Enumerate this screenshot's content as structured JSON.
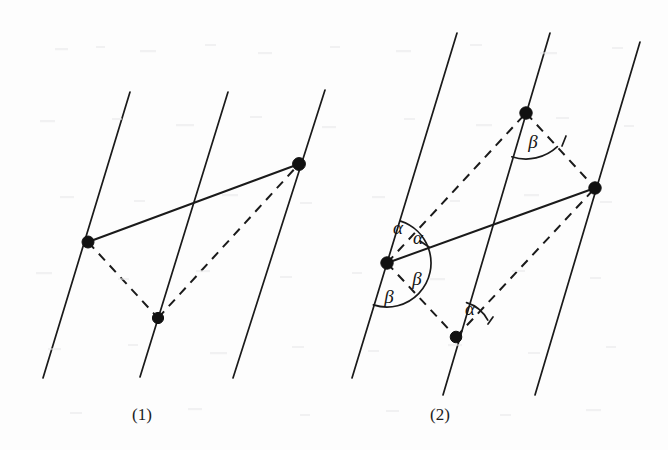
{
  "figure": {
    "background_color": "#fdfdfd",
    "ink_color": "#1a1a1a",
    "panels": [
      {
        "id": "panel-1",
        "caption": "(1)",
        "caption_x": 142,
        "caption_y": 420,
        "parallel_lines": [
          {
            "name": "line-left",
            "x1": 130,
            "y1": 92,
            "x2": 43,
            "y2": 378
          },
          {
            "name": "line-middle",
            "x1": 228,
            "y1": 92,
            "x2": 140,
            "y2": 377
          },
          {
            "name": "line-right",
            "x1": 325,
            "y1": 90,
            "x2": 233,
            "y2": 378
          }
        ],
        "points": [
          {
            "name": "point-left",
            "x": 88,
            "y": 242,
            "r": 6.0
          },
          {
            "name": "point-top-right",
            "x": 299,
            "y": 164,
            "r": 6.4
          },
          {
            "name": "point-bottom-middle",
            "x": 158,
            "y": 318,
            "r": 5.6
          }
        ],
        "solid_segments": [
          {
            "name": "segment-left-to-topright",
            "x1": 88,
            "y1": 242,
            "x2": 299,
            "y2": 164
          }
        ],
        "dashed_segments": [
          {
            "name": "segment-left-to-bottom",
            "x1": 88,
            "y1": 242,
            "x2": 158,
            "y2": 318
          },
          {
            "name": "segment-bottom-to-topright",
            "x1": 158,
            "y1": 318,
            "x2": 299,
            "y2": 164
          }
        ],
        "angle_labels": [],
        "angle_arcs": []
      },
      {
        "id": "panel-2",
        "caption": "(2)",
        "caption_x": 440,
        "caption_y": 420,
        "parallel_lines": [
          {
            "name": "line-left",
            "x1": 457,
            "y1": 33,
            "x2": 352,
            "y2": 378
          },
          {
            "name": "line-middle",
            "x1": 550,
            "y1": 33,
            "x2": 443,
            "y2": 395
          },
          {
            "name": "line-right",
            "x1": 640,
            "y1": 42,
            "x2": 535,
            "y2": 395
          }
        ],
        "points": [
          {
            "name": "point-top-middle",
            "x": 526,
            "y": 113,
            "r": 6.2
          },
          {
            "name": "point-right",
            "x": 595,
            "y": 188,
            "r": 6.2
          },
          {
            "name": "point-left",
            "x": 387,
            "y": 263,
            "r": 6.2
          },
          {
            "name": "point-bottom-middle",
            "x": 456,
            "y": 337,
            "r": 5.8
          }
        ],
        "solid_segments": [
          {
            "name": "segment-left-to-right",
            "x1": 387,
            "y1": 263,
            "x2": 595,
            "y2": 188
          }
        ],
        "dashed_segments": [
          {
            "name": "segment-left-to-topmiddle",
            "x1": 387,
            "y1": 263,
            "x2": 526,
            "y2": 113
          },
          {
            "name": "segment-topmiddle-to-right",
            "x1": 526,
            "y1": 113,
            "x2": 595,
            "y2": 188
          },
          {
            "name": "segment-left-to-bottommiddle",
            "x1": 387,
            "y1": 263,
            "x2": 456,
            "y2": 337
          },
          {
            "name": "segment-bottommiddle-to-right",
            "x1": 456,
            "y1": 337,
            "x2": 595,
            "y2": 188
          }
        ],
        "angle_labels": [
          {
            "name": "angle-label-alpha-upper-left",
            "text": "α",
            "x": 398,
            "y": 234
          },
          {
            "name": "angle-label-alpha-upper-right",
            "text": "α",
            "x": 418,
            "y": 244
          },
          {
            "name": "angle-label-beta-lower-right",
            "text": "β",
            "x": 417,
            "y": 285
          },
          {
            "name": "angle-label-beta-lower-left",
            "text": "β",
            "x": 389,
            "y": 303
          },
          {
            "name": "angle-label-beta-top",
            "text": "β",
            "x": 533,
            "y": 148
          },
          {
            "name": "angle-label-alpha-bottom",
            "text": "α",
            "x": 470,
            "y": 315
          }
        ],
        "angle_arcs": [
          {
            "name": "arc-left-vertex-upper",
            "cx": 387,
            "cy": 263,
            "r": 44,
            "start_deg": -72,
            "end_deg": -20
          },
          {
            "name": "arc-left-vertex-lower",
            "cx": 387,
            "cy": 263,
            "r": 44,
            "start_deg": -20,
            "end_deg": 108
          },
          {
            "name": "arc-top-vertex",
            "cx": 526,
            "cy": 113,
            "r": 46,
            "start_deg": 47,
            "end_deg": 108
          },
          {
            "name": "arc-bottom-vertex",
            "cx": 456,
            "cy": 337,
            "r": 36,
            "start_deg": -73,
            "end_deg": -28
          }
        ],
        "arc_ticks": [
          {
            "name": "arc-tick-left-vertex",
            "x1": 429,
            "y1": 247,
            "x2": 420,
            "y2": 241
          },
          {
            "name": "arc-tick-top-vertex",
            "x1": 562,
            "y1": 146,
            "x2": 566,
            "y2": 136
          },
          {
            "name": "arc-tick-bottom-vertex",
            "x1": 488,
            "y1": 324,
            "x2": 493,
            "y2": 317
          }
        ]
      }
    ]
  }
}
